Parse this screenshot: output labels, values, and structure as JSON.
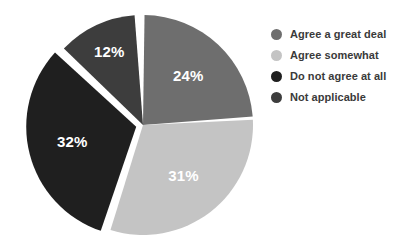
{
  "chart_data": {
    "type": "pie",
    "title": "",
    "subtitle": "",
    "xlabel": "",
    "ylabel": "",
    "grid": false,
    "legend_position": "right",
    "start_angle_deg": 0,
    "direction": "clockwise",
    "units": "percent",
    "total": 99,
    "categories": [
      "Agree a great deal",
      "Agree somewhat",
      "Do not agree at all",
      "Not applicable"
    ],
    "values": [
      24,
      31,
      32,
      12
    ],
    "data_labels": [
      "24%",
      "31%",
      "32%",
      "12%"
    ],
    "colors": [
      "#6e6e6e",
      "#c4c4c4",
      "#1f1f1f",
      "#3d3d3d"
    ],
    "exploded": [
      false,
      false,
      true,
      false
    ],
    "slices": [
      {
        "label": "Agree a great deal",
        "value": 24,
        "data_label": "24%",
        "color": "#6e6e6e",
        "start_deg": 0,
        "end_deg": 86.4,
        "exploded": false
      },
      {
        "label": "Agree somewhat",
        "value": 31,
        "data_label": "31%",
        "color": "#c4c4c4",
        "start_deg": 86.4,
        "end_deg": 198.0,
        "exploded": false
      },
      {
        "label": "Do not agree at all",
        "value": 32,
        "data_label": "32%",
        "color": "#1f1f1f",
        "start_deg": 198.0,
        "end_deg": 313.2,
        "exploded": true
      },
      {
        "label": "Not applicable",
        "value": 12,
        "data_label": "12%",
        "color": "#3d3d3d",
        "start_deg": 313.2,
        "end_deg": 356.4,
        "exploded": false
      }
    ]
  },
  "legend": {
    "items": [
      {
        "label": "Agree a great deal",
        "color": "#6e6e6e"
      },
      {
        "label": "Agree somewhat",
        "color": "#c4c4c4"
      },
      {
        "label": "Do not agree at all",
        "color": "#1f1f1f"
      },
      {
        "label": "Not applicable",
        "color": "#3d3d3d"
      }
    ]
  },
  "canvas": {
    "background": "#ffffff",
    "label_text_color": "#ffffff",
    "legend_text_color": "#3a3a3a"
  }
}
